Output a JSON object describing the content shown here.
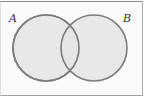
{
  "diagram": {
    "type": "venn",
    "sets": [
      {
        "label": "A",
        "cx": 46,
        "cy": 48,
        "r": 33
      },
      {
        "label": "B",
        "cx": 94,
        "cy": 48,
        "r": 33
      }
    ],
    "colors": {
      "fill": "#e4e4e4",
      "stroke": "#7d7d7d",
      "background": "#fbfbfb"
    }
  }
}
